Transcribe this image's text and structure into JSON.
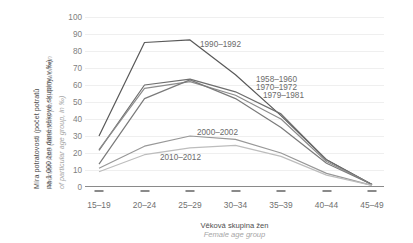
{
  "axes": {
    "y_title_cz": "Míra potratovosti (počet potratů",
    "y_title_cz2": "na 1 000 žen dané věkové skupiny, v ‰)",
    "y_title_en": "Abortion rate (abortions per 1,000 women",
    "y_title_en2": "of particular age group, in ‰)",
    "x_title_cz": "Věková skupina žen",
    "x_title_en": "Female age group"
  },
  "chart_data": {
    "type": "line",
    "title": "",
    "xlabel": "Věková skupina žen / Female age group",
    "ylabel": "Míra potratovosti (počet potratů na 1 000 žen dané věkové skupiny, v ‰)",
    "categories": [
      "15–19",
      "20–24",
      "25–29",
      "30–34",
      "35–39",
      "40–44",
      "45–49"
    ],
    "ylim": [
      0,
      100
    ],
    "yticks": [
      0,
      10,
      20,
      30,
      40,
      50,
      60,
      70,
      80,
      90,
      100
    ],
    "grid": true,
    "legend": "inline-annotations",
    "series": [
      {
        "name": "1990–1992",
        "color": "#595959",
        "values": [
          30.0,
          85.0,
          86.5,
          66.0,
          42.0,
          16.0,
          1.5
        ]
      },
      {
        "name": "1958–1960",
        "color": "#6e6e6e",
        "values": [
          21.5,
          60.0,
          63.5,
          56.0,
          43.0,
          16.0,
          1.5
        ]
      },
      {
        "name": "1970–1972",
        "color": "#8c8c8c",
        "values": [
          22.0,
          58.0,
          62.0,
          54.0,
          40.0,
          15.0,
          1.5
        ]
      },
      {
        "name": "1979–1981",
        "color": "#7a7a7a",
        "values": [
          13.5,
          52.0,
          63.0,
          52.0,
          35.0,
          14.0,
          1.5
        ]
      },
      {
        "name": "2000–2002",
        "color": "#989898",
        "values": [
          11.0,
          24.0,
          30.0,
          28.0,
          20.0,
          8.0,
          1.0
        ]
      },
      {
        "name": "2010–2012",
        "color": "#bdbdbd",
        "values": [
          9.0,
          19.0,
          23.0,
          24.5,
          18.0,
          7.0,
          1.0
        ]
      }
    ],
    "annotations": [
      {
        "text": "1990–1992",
        "x": 200,
        "y": 40
      },
      {
        "text": "1958–1960",
        "x": 256,
        "y": 75
      },
      {
        "text": "1970–1972",
        "x": 256,
        "y": 83
      },
      {
        "text": "1979–1981",
        "x": 263,
        "y": 91
      },
      {
        "text": "2000–2002",
        "x": 197,
        "y": 128
      },
      {
        "text": "2010–2012",
        "x": 160,
        "y": 153
      }
    ]
  }
}
